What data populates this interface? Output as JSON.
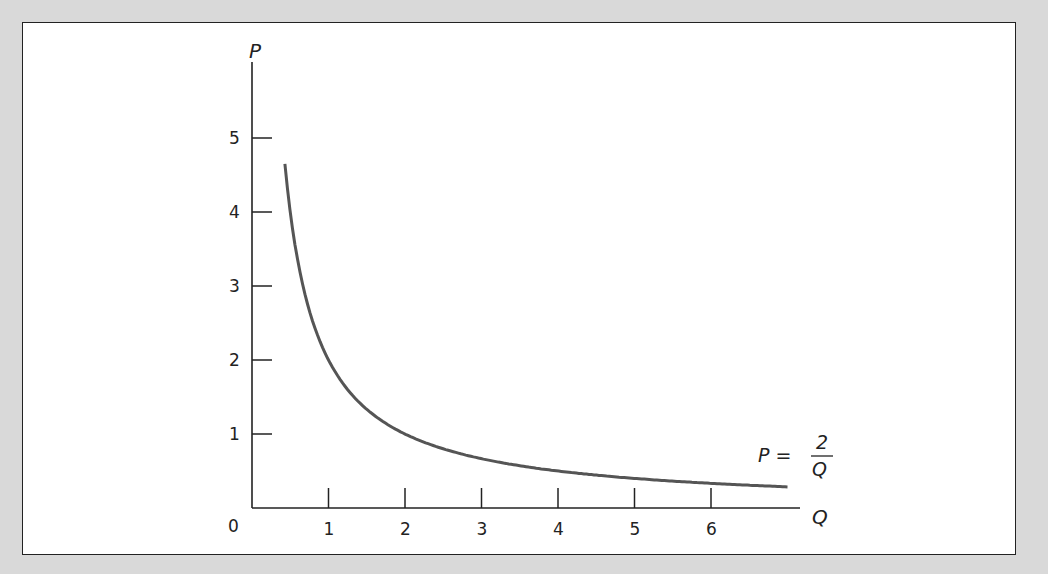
{
  "chart_data": {
    "type": "line",
    "title": "",
    "xlabel": "Q",
    "ylabel": "P",
    "origin_label": "0",
    "xlim": [
      0,
      7
    ],
    "ylim": [
      0,
      6
    ],
    "x_ticks": [
      1,
      2,
      3,
      4,
      5,
      6
    ],
    "x_tick_labels": [
      "1",
      "2",
      "3",
      "4",
      "5",
      "6"
    ],
    "y_ticks": [
      1,
      2,
      3,
      4,
      5
    ],
    "y_tick_labels": [
      "1",
      "2",
      "3",
      "4",
      "5"
    ],
    "grid": false,
    "legend": null,
    "series": [
      {
        "name": "P = 2/Q",
        "function": "P = 2/Q",
        "x": [
          0.43,
          0.5,
          0.75,
          1,
          1.25,
          1.5,
          2,
          2.5,
          3,
          4,
          5,
          6,
          6.9
        ],
        "values": [
          4.65,
          4.0,
          2.67,
          2.0,
          1.6,
          1.33,
          1.0,
          0.8,
          0.67,
          0.5,
          0.4,
          0.33,
          0.29
        ]
      }
    ],
    "annotations": [
      {
        "text": "P = 2/Q",
        "numerator": "2",
        "denominator": "Q",
        "lhs": "P =",
        "position": "near right end of curve"
      }
    ]
  }
}
